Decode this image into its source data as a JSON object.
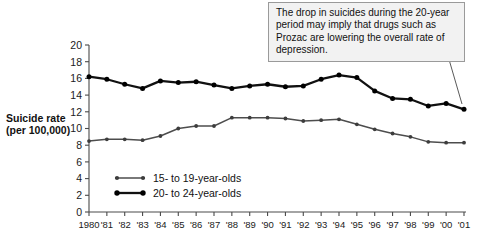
{
  "figure": {
    "annotation": {
      "text": "The drop in suicides during the 20-year period may imply that drugs such as Prozac are lowering the overall rate of depression."
    }
  },
  "chart_data": {
    "type": "line",
    "title": "",
    "xlabel": "",
    "ylabel": "Suicide rate (per 100,000)",
    "ylabel_line1": "Suicide rate",
    "ylabel_line2": "(per 100,000)",
    "ylim": [
      0,
      20
    ],
    "yticks": [
      0,
      2,
      4,
      6,
      8,
      10,
      12,
      14,
      16,
      18,
      20
    ],
    "ytick_labels": [
      "0",
      "2",
      "4",
      "6",
      "8",
      "10",
      "12",
      "14",
      "16",
      "18",
      "20"
    ],
    "grid": false,
    "legend_position": "inside-lower-left",
    "categories": [
      1980,
      1981,
      1982,
      1983,
      1984,
      1985,
      1986,
      1987,
      1988,
      1989,
      1990,
      1991,
      1992,
      1993,
      1994,
      1995,
      1996,
      1997,
      1998,
      1999,
      2000,
      2001
    ],
    "xtick_labels": [
      "1980",
      "'81",
      "'82",
      "'83",
      "'84",
      "'85",
      "'86",
      "'87",
      "'88",
      "'89",
      "'90",
      "'91",
      "'92",
      "'93",
      "'94",
      "'95",
      "'96",
      "'97",
      "'98",
      "'99",
      "'00",
      "'01"
    ],
    "series": [
      {
        "name": "15- to 19-year-olds",
        "color": "#4d4d4d",
        "values": [
          8.5,
          8.7,
          8.7,
          8.6,
          9.1,
          10.0,
          10.3,
          10.3,
          11.3,
          11.3,
          11.3,
          11.2,
          10.9,
          11.0,
          11.1,
          10.5,
          9.9,
          9.4,
          9.0,
          8.4,
          8.3,
          8.3
        ]
      },
      {
        "name": "20- to 24-year-olds",
        "color": "#111111",
        "values": [
          16.2,
          15.9,
          15.3,
          14.8,
          15.7,
          15.5,
          15.6,
          15.2,
          14.8,
          15.1,
          15.3,
          15.0,
          15.1,
          15.9,
          16.4,
          16.1,
          14.5,
          13.6,
          13.5,
          12.7,
          13.0,
          12.3
        ]
      }
    ],
    "legend": [
      {
        "label": "15- to 19-year-olds"
      },
      {
        "label": "20- to 24-year-olds"
      }
    ]
  }
}
